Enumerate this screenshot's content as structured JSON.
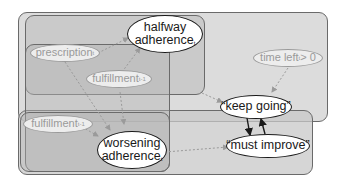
{
  "boxes": [
    {
      "id": "outer-top",
      "x": 18,
      "y": 12,
      "w": 310,
      "h": 110,
      "fill": "#dcdcdc"
    },
    {
      "id": "outer-bottom",
      "x": 18,
      "y": 110,
      "w": 295,
      "h": 65,
      "fill": "#d2d2d2"
    },
    {
      "id": "halfway-box",
      "x": 25,
      "y": 15,
      "w": 180,
      "h": 80,
      "fill": "#c8c8c8"
    },
    {
      "id": "middle-box",
      "x": 25,
      "y": 44,
      "w": 145,
      "h": 128,
      "fill": "#c6c6c6"
    },
    {
      "id": "worsening-box",
      "x": 20,
      "y": 112,
      "w": 150,
      "h": 60,
      "fill": "#c4c4c4"
    }
  ],
  "nodes": {
    "halfway": {
      "line1": "halfway",
      "line2": "adherence",
      "sub": "t"
    },
    "prescription": {
      "label": "prescription",
      "sub": "t"
    },
    "fulfillment_t1": {
      "label": "fulfillment",
      "sub": "t-1"
    },
    "time_left": {
      "label": "time left",
      "sub": "t",
      "suffix": " > 0"
    },
    "fulfillment_t1b": {
      "label": "fulfillment",
      "sub": "t-1"
    },
    "worsening": {
      "line1": "worsening",
      "line2": "adherence",
      "sub": "t"
    },
    "keep_going": {
      "label": "“keep going”"
    },
    "must_improve": {
      "label": "“must improve”"
    }
  },
  "colors": {
    "dashed_edge": "#9a9a9a",
    "solid_edge": "#1a1a1a"
  }
}
